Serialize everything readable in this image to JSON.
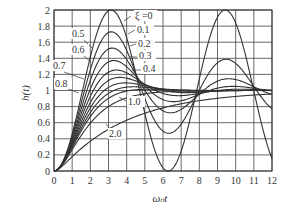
{
  "chart_data": {
    "type": "line",
    "title": "",
    "xlabel": "ωₙt",
    "ylabel": "h(t)",
    "xlim": [
      0,
      12
    ],
    "ylim": [
      0,
      2
    ],
    "grid": true,
    "x_ticks": [
      "0",
      "1",
      "2",
      "3",
      "4",
      "5",
      "6",
      "7",
      "8",
      "9",
      "10",
      "11",
      "12"
    ],
    "y_ticks": [
      "0",
      "0.2",
      "0.4",
      "0.6",
      "0.8",
      "1",
      "1.2",
      "1.4",
      "1.6",
      "1.8",
      "2"
    ],
    "legend": "inline labels",
    "parameter_symbol": "ξ",
    "x": [
      0,
      1,
      2,
      3,
      4,
      5,
      6,
      7,
      8,
      9,
      10,
      11,
      12
    ],
    "series": [
      {
        "name": "ξ=0",
        "zeta": 0,
        "values": [
          0,
          0.46,
          1.42,
          1.99,
          1.65,
          0.72,
          0.04,
          0.25,
          1.15,
          1.91,
          1.84,
          1.0,
          0.16
        ]
      },
      {
        "name": "0.1",
        "zeta": 0.1,
        "values": [
          0,
          0.44,
          1.33,
          1.74,
          1.4,
          0.78,
          0.46,
          0.68,
          1.16,
          1.44,
          1.32,
          1.01,
          0.82
        ]
      },
      {
        "name": "0.2",
        "zeta": 0.2,
        "values": [
          0,
          0.42,
          1.24,
          1.53,
          1.23,
          0.86,
          0.76,
          0.93,
          1.13,
          1.18,
          1.07,
          0.96,
          0.96
        ]
      },
      {
        "name": "0.3",
        "zeta": 0.3,
        "values": [
          0,
          0.41,
          1.16,
          1.37,
          1.13,
          0.92,
          0.9,
          1.01,
          1.08,
          1.05,
          0.99,
          0.98,
          1.0
        ]
      },
      {
        "name": "0.4",
        "zeta": 0.4,
        "values": [
          0,
          0.39,
          1.07,
          1.25,
          1.08,
          0.96,
          0.97,
          1.02,
          1.03,
          1.0,
          0.99,
          1.0,
          1.0
        ]
      },
      {
        "name": "0.5",
        "zeta": 0.5,
        "values": [
          0,
          0.38,
          1.0,
          1.15,
          1.06,
          0.99,
          0.99,
          1.01,
          1.0,
          1.0,
          1.0,
          1.0,
          1.0
        ]
      },
      {
        "name": "0.6",
        "zeta": 0.6,
        "values": [
          0,
          0.36,
          0.93,
          1.08,
          1.04,
          1.0,
          1.0,
          1.0,
          1.0,
          1.0,
          1.0,
          1.0,
          1.0
        ]
      },
      {
        "name": "0.7",
        "zeta": 0.7,
        "values": [
          0,
          0.35,
          0.86,
          1.03,
          1.02,
          1.0,
          1.0,
          1.0,
          1.0,
          1.0,
          1.0,
          1.0,
          1.0
        ]
      },
      {
        "name": "0.8",
        "zeta": 0.8,
        "values": [
          0,
          0.33,
          0.8,
          0.98,
          1.01,
          1.01,
          1.0,
          1.0,
          1.0,
          1.0,
          1.0,
          1.0,
          1.0
        ]
      },
      {
        "name": "1.0",
        "zeta": 1.0,
        "values": [
          0,
          0.26,
          0.59,
          0.8,
          0.91,
          0.96,
          0.98,
          0.99,
          1.0,
          1.0,
          1.0,
          1.0,
          1.0
        ]
      },
      {
        "name": "2.0",
        "zeta": 2.0,
        "values": [
          0,
          0.16,
          0.33,
          0.47,
          0.59,
          0.68,
          0.75,
          0.81,
          0.85,
          0.88,
          0.91,
          0.93,
          0.95
        ]
      }
    ],
    "annotations": [
      {
        "text": "ξ =0",
        "x": 135,
        "y": 19,
        "tx": 131,
        "ty": 16,
        "ax": 124,
        "ay": 21
      },
      {
        "text": "0.1",
        "x": 137,
        "y": 33,
        "tx": 135,
        "ty": 30,
        "ax": 128,
        "ay": 34
      },
      {
        "text": "0.2",
        "x": 138,
        "y": 47,
        "tx": 136,
        "ty": 44,
        "ax": 130,
        "ay": 46
      },
      {
        "text": "0.3",
        "x": 139,
        "y": 59,
        "tx": 137,
        "ty": 57,
        "ax": 130,
        "ay": 57
      },
      {
        "text": "0.4",
        "x": 143,
        "y": 72,
        "tx": 141,
        "ty": 70,
        "ax": 132,
        "ay": 70
      },
      {
        "text": "0.5",
        "x": 72,
        "y": 37,
        "tx": 84,
        "ty": 40,
        "ax": 92,
        "ay": 48
      },
      {
        "text": "0.6",
        "x": 72,
        "y": 53,
        "tx": 84,
        "ty": 56,
        "ax": 91,
        "ay": 62
      },
      {
        "text": "0.7",
        "x": 53,
        "y": 69,
        "tx": 64,
        "ty": 72,
        "ax": 84,
        "ay": 79
      },
      {
        "text": "0.8",
        "x": 55,
        "y": 87,
        "tx": 66,
        "ty": 88,
        "ax": 79,
        "ay": 93
      },
      {
        "text": "1.0",
        "x": 128,
        "y": 105,
        "tx": 126,
        "ty": 101,
        "ax": 119,
        "ay": 97
      },
      {
        "text": "2.0",
        "x": 109,
        "y": 137,
        "tx": 111,
        "ty": 130,
        "ax": 106,
        "ay": 124
      }
    ]
  },
  "layout": {
    "plot_left": 54,
    "plot_right": 272,
    "plot_top": 10,
    "plot_bottom": 171,
    "line_color": "#333333",
    "grid_color": "#444444"
  }
}
